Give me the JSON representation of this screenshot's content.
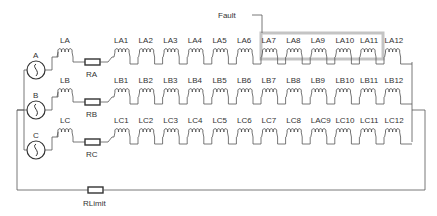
{
  "diagram": {
    "fault": {
      "label": "Fault",
      "highlight_color": "#bdbdbd"
    },
    "phases": [
      {
        "id": "A",
        "source_label": "A",
        "line_inductor": "LA",
        "resistor": "RA",
        "segments": [
          "LA1",
          "LA2",
          "LA3",
          "LA4",
          "LA5",
          "LA6",
          "LA7",
          "LA8",
          "LA9",
          "LA10",
          "LA11",
          "LA12"
        ]
      },
      {
        "id": "B",
        "source_label": "B",
        "line_inductor": "LB",
        "resistor": "RB",
        "segments": [
          "LB1",
          "LB2",
          "LB3",
          "LB4",
          "LB5",
          "LB6",
          "LB7",
          "LB8",
          "LB9",
          "LB10",
          "LB11",
          "LB12"
        ]
      },
      {
        "id": "C",
        "source_label": "C",
        "line_inductor": "LC",
        "resistor": "RC",
        "segments": [
          "LC1",
          "LC2",
          "LC3",
          "LC4",
          "LC5",
          "LC6",
          "LC7",
          "LC8",
          "LAC9",
          "LC10",
          "LC11",
          "LC12"
        ]
      }
    ],
    "limit_resistor": "RLimit",
    "fault_range": {
      "phase": "A",
      "from_index": 6,
      "to_index": 10
    },
    "icons": {
      "source": "ac-voltage-source-icon",
      "inductor": "inductor-coil-icon",
      "resistor": "resistor-icon"
    }
  }
}
